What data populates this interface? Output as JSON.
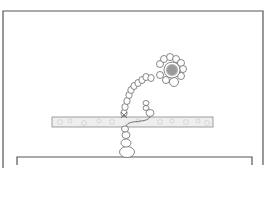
{
  "scene": {
    "colors": {
      "background": "#ffffff",
      "line": "#555555",
      "pebble_stroke": "#6a6a6a",
      "plank_fill": "#eeeeee",
      "plank_stroke": "#888888",
      "core_fill": "#9a9a9a",
      "core_ring": "#b5b5b5"
    },
    "outer_frame": {
      "left_x": 3,
      "right_x": 263,
      "top_y": 11,
      "left_bottom_y": 168,
      "right_bottom_y": 165
    },
    "ground_box": {
      "left_x": 17,
      "right_x": 252,
      "top_y": 157,
      "bottom_y": 165
    },
    "plank": {
      "x": 52,
      "y": 117,
      "width": 161,
      "height": 10
    },
    "base_stack": [
      {
        "cx": 127,
        "cy": 152,
        "rx": 7.5,
        "ry": 5.5
      },
      {
        "cx": 126,
        "cy": 143,
        "rx": 5,
        "ry": 4
      },
      {
        "cx": 126,
        "cy": 135,
        "rx": 4,
        "ry": 3.5
      },
      {
        "cx": 125,
        "cy": 129,
        "rx": 3.5,
        "ry": 3
      }
    ],
    "chain": [
      {
        "cx": 124,
        "cy": 113,
        "r": 3.5
      },
      {
        "cx": 125,
        "cy": 107,
        "r": 3.5
      },
      {
        "cx": 127,
        "cy": 101,
        "r": 3.5
      },
      {
        "cx": 129,
        "cy": 95,
        "r": 3.5
      },
      {
        "cx": 131,
        "cy": 90,
        "r": 3.5
      },
      {
        "cx": 134,
        "cy": 86,
        "r": 3.5
      },
      {
        "cx": 138,
        "cy": 83,
        "r": 3.5
      },
      {
        "cx": 142,
        "cy": 80,
        "r": 3.5
      },
      {
        "cx": 146,
        "cy": 77,
        "r": 3.5
      },
      {
        "cx": 151,
        "cy": 78,
        "r": 3.5
      }
    ],
    "flower": {
      "center": {
        "cx": 172,
        "cy": 70,
        "r": 5.5,
        "ring_r": 8
      },
      "petals": [
        {
          "cx": 160,
          "cy": 64,
          "r": 3.5
        },
        {
          "cx": 164,
          "cy": 59,
          "r": 3.5
        },
        {
          "cx": 170,
          "cy": 57,
          "r": 3.5
        },
        {
          "cx": 176,
          "cy": 59,
          "r": 3.5
        },
        {
          "cx": 181,
          "cy": 63,
          "r": 3.5
        },
        {
          "cx": 183,
          "cy": 69,
          "r": 3.5
        },
        {
          "cx": 181,
          "cy": 76,
          "r": 3.5
        },
        {
          "cx": 174,
          "cy": 82,
          "r": 4.5
        },
        {
          "cx": 166,
          "cy": 80,
          "r": 3.5
        },
        {
          "cx": 160,
          "cy": 75,
          "r": 3.5
        }
      ]
    },
    "small_stack": [
      {
        "cx": 146,
        "cy": 103,
        "rx": 3,
        "ry": 2.5
      },
      {
        "cx": 146,
        "cy": 108,
        "rx": 3,
        "ry": 2.5
      },
      {
        "cx": 150,
        "cy": 113,
        "rx": 4,
        "ry": 3.5
      }
    ],
    "knot": {
      "cx": 124,
      "cy": 115
    },
    "wire_path": "M150 116 C 150 121, 140 121, 133 122 C 126 123, 126 126, 125 130",
    "plank_texture": [
      {
        "cx": 60,
        "cy": 122,
        "r": 2.5
      },
      {
        "cx": 70,
        "cy": 121,
        "r": 2
      },
      {
        "cx": 84,
        "cy": 123,
        "r": 2.5
      },
      {
        "cx": 99,
        "cy": 121,
        "r": 2
      },
      {
        "cx": 112,
        "cy": 122,
        "r": 2.5
      },
      {
        "cx": 138,
        "cy": 121,
        "r": 2
      },
      {
        "cx": 160,
        "cy": 122,
        "r": 2.5
      },
      {
        "cx": 172,
        "cy": 121,
        "r": 2
      },
      {
        "cx": 186,
        "cy": 122,
        "r": 2.5
      },
      {
        "cx": 198,
        "cy": 121,
        "r": 2
      },
      {
        "cx": 207,
        "cy": 123,
        "r": 2.5
      }
    ]
  }
}
